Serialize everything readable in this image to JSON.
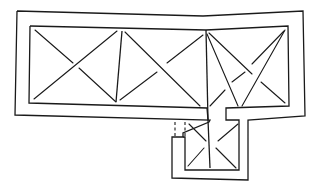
{
  "diagram": {
    "type": "architectural-floor-plan",
    "title": "",
    "colors": {
      "line": "#1a1a1a",
      "background": "#ffffff"
    },
    "outer_wall": [
      [
        17,
        11
      ],
      [
        203,
        16
      ],
      [
        303,
        11
      ],
      [
        305,
        116
      ],
      [
        248,
        120
      ],
      [
        248,
        180
      ],
      [
        172,
        178
      ],
      [
        172,
        137
      ],
      [
        183,
        137
      ],
      [
        183,
        133
      ],
      [
        209,
        122
      ],
      [
        210,
        120
      ],
      [
        15,
        115
      ],
      [
        17,
        11
      ]
    ],
    "inner_wall_main": [
      [
        30,
        26
      ],
      [
        206,
        30
      ],
      [
        288,
        26
      ],
      [
        289,
        106
      ],
      [
        226,
        108
      ],
      [
        226,
        120
      ],
      [
        239,
        120
      ],
      [
        239,
        170
      ],
      [
        185,
        170
      ],
      [
        185,
        137
      ],
      [
        183,
        137
      ]
    ],
    "inner_wall_main_left": [
      [
        30,
        26
      ],
      [
        29,
        103
      ],
      [
        207,
        108
      ],
      [
        208,
        120
      ]
    ],
    "inner_wall_right_notch": [
      [
        226,
        108
      ],
      [
        226,
        120
      ],
      [
        239,
        120
      ]
    ],
    "bay_dividers": [
      [
        [
          122,
          31
        ],
        [
          116,
          102
        ]
      ],
      [
        [
          206,
          30
        ],
        [
          208,
          120
        ]
      ],
      [
        [
          208,
          120
        ],
        [
          210,
          168
        ]
      ]
    ],
    "vault_lines": [
      [
        [
          35,
          30
        ],
        [
          73,
          63
        ]
      ],
      [
        [
          79,
          68
        ],
        [
          116,
          102
        ]
      ],
      [
        [
          117,
          31
        ],
        [
          34,
          99
        ]
      ],
      [
        [
          125,
          32
        ],
        [
          200,
          106
        ]
      ],
      [
        [
          203,
          35
        ],
        [
          167,
          63
        ]
      ],
      [
        [
          157,
          72
        ],
        [
          120,
          100
        ]
      ],
      [
        [
          207,
          34
        ],
        [
          238,
          106
        ]
      ],
      [
        [
          209,
          33
        ],
        [
          252,
          74
        ]
      ],
      [
        [
          261,
          82
        ],
        [
          285,
          103
        ]
      ],
      [
        [
          284,
          31
        ],
        [
          252,
          64
        ]
      ],
      [
        [
          245,
          72
        ],
        [
          232,
          82
        ]
      ],
      [
        [
          225,
          90
        ],
        [
          210,
          106
        ]
      ],
      [
        [
          285,
          30
        ],
        [
          242,
          106
        ]
      ],
      [
        [
          189,
          124
        ],
        [
          206,
          141
        ]
      ],
      [
        [
          216,
          148
        ],
        [
          236,
          168
        ]
      ],
      [
        [
          238,
          124
        ],
        [
          218,
          141
        ]
      ],
      [
        [
          204,
          148
        ],
        [
          188,
          166
        ]
      ]
    ],
    "dashed_lines": [
      [
        [
          175,
          122
        ],
        [
          175,
          137
        ]
      ],
      [
        [
          185,
          122
        ],
        [
          185,
          137
        ]
      ]
    ]
  }
}
